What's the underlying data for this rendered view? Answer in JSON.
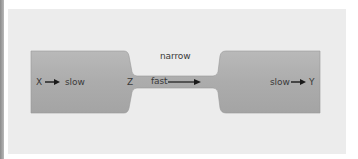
{
  "diagram": {
    "labels": {
      "inlet_point": "X",
      "inlet_speed": "slow",
      "neck_point": "Z",
      "neck_speed": "fast",
      "neck_caption": "narrow",
      "outlet_speed": "slow",
      "outlet_point": "Y"
    },
    "colors": {
      "panel_background": "#ececec",
      "pipe_fill_light": "#bdbdbd",
      "pipe_fill_dark": "#9c9c9c",
      "text": "#3a3a3a",
      "arrow": "#1a1a1a"
    }
  }
}
